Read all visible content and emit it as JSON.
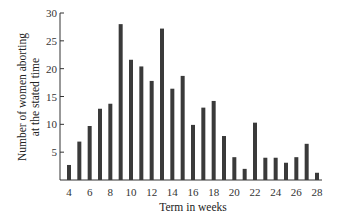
{
  "chart_data": {
    "type": "bar",
    "title": "",
    "xlabel": "Term in weeks",
    "ylabel_lines": [
      "Number of women aborting",
      "at the stated time"
    ],
    "ylabel": "Number of women aborting at the stated time",
    "categories": [
      4,
      5,
      6,
      7,
      8,
      9,
      10,
      11,
      12,
      13,
      14,
      15,
      16,
      17,
      18,
      19,
      20,
      21,
      22,
      23,
      24,
      25,
      26,
      27,
      28
    ],
    "values": [
      2.7,
      6.9,
      9.7,
      12.8,
      13.7,
      28,
      21.6,
      20.4,
      17.8,
      27.2,
      16.4,
      18.7,
      9.9,
      13,
      14.2,
      7.9,
      4.1,
      2,
      10.3,
      4,
      4,
      3.1,
      4.1,
      6.5,
      1.3
    ],
    "ylim": [
      0,
      30
    ],
    "yticks": [
      5,
      10,
      15,
      20,
      25,
      30
    ],
    "xticks": [
      4,
      6,
      8,
      10,
      12,
      14,
      16,
      18,
      20,
      22,
      24,
      26,
      28
    ],
    "grid": false,
    "legend": null,
    "bar_color": "#3a3a3a"
  }
}
